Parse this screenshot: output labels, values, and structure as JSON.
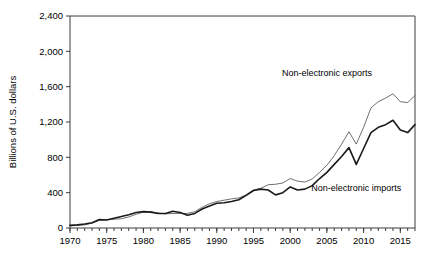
{
  "chart_data": {
    "type": "line",
    "title": "",
    "subtitle": "",
    "xlabel": "",
    "ylabel": "Billions of U.S. dollars",
    "xlim": [
      1970,
      2017
    ],
    "ylim": [
      0,
      2400
    ],
    "grid": false,
    "legend_position": "inline-annotations",
    "y_ticks": [
      0,
      400,
      800,
      1200,
      1600,
      2000,
      2400
    ],
    "y_tick_labels": [
      "0",
      "400",
      "800",
      "1,200",
      "1,600",
      "2,000",
      "2,400"
    ],
    "x_ticks": [
      1970,
      1975,
      1980,
      1985,
      1990,
      1995,
      2000,
      2005,
      2010,
      2015
    ],
    "x_tick_labels": [
      "1970",
      "1975",
      "1980",
      "1985",
      "1990",
      "1995",
      "2000",
      "2005",
      "2010",
      "2015"
    ],
    "x_minor_tick_interval": 1,
    "x": [
      1970,
      1971,
      1972,
      1973,
      1974,
      1975,
      1976,
      1977,
      1978,
      1979,
      1980,
      1981,
      1982,
      1983,
      1984,
      1985,
      1986,
      1987,
      1988,
      1989,
      1990,
      1991,
      1992,
      1993,
      1994,
      1995,
      1996,
      1997,
      1998,
      1999,
      2000,
      2001,
      2002,
      2003,
      2004,
      2005,
      2006,
      2007,
      2008,
      2009,
      2010,
      2011,
      2012,
      2013,
      2014,
      2015,
      2016,
      2017
    ],
    "series": [
      {
        "name": "Non-electronic exports",
        "style": "thin",
        "color": "#555555",
        "values": [
          25,
          30,
          35,
          55,
          85,
          95,
          100,
          105,
          125,
          155,
          180,
          185,
          170,
          160,
          165,
          165,
          165,
          185,
          235,
          275,
          300,
          315,
          330,
          340,
          375,
          430,
          450,
          490,
          495,
          510,
          560,
          530,
          520,
          555,
          630,
          710,
          820,
          950,
          1090,
          950,
          1140,
          1360,
          1430,
          1470,
          1520,
          1430,
          1420,
          1500
        ]
      },
      {
        "name": "Non-electronic imports",
        "style": "thick",
        "color": "#1a1a1a",
        "values": [
          30,
          35,
          45,
          60,
          95,
          90,
          110,
          130,
          150,
          175,
          185,
          180,
          165,
          165,
          190,
          175,
          145,
          165,
          215,
          250,
          280,
          285,
          300,
          320,
          370,
          425,
          440,
          430,
          375,
          400,
          465,
          430,
          440,
          480,
          560,
          630,
          720,
          810,
          910,
          720,
          900,
          1080,
          1140,
          1170,
          1220,
          1110,
          1080,
          1170
        ]
      }
    ],
    "annotations": [
      {
        "text": "Non-electronic exports",
        "x": 2005,
        "y": 1720
      },
      {
        "text": "Non-electronic imports",
        "x": 2009,
        "y": 420
      }
    ]
  },
  "figure": {
    "background_color": "#ffffff",
    "axis_color": "#3c3c3c"
  }
}
